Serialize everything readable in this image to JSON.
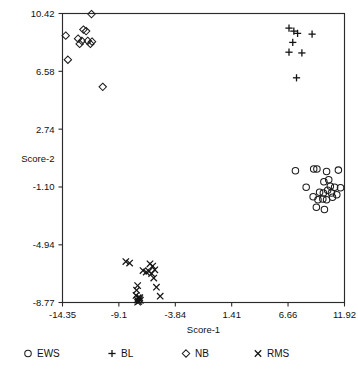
{
  "chart_data": {
    "type": "scatter",
    "title": "",
    "xlabel": "Score-1",
    "ylabel": "Score-2",
    "xlim": [
      -14.35,
      11.92
    ],
    "ylim": [
      -8.77,
      10.42
    ],
    "xticks": [
      "-14.35",
      "-9.1",
      "-3.84",
      "1.41",
      "6.66",
      "11.92"
    ],
    "xtick_values": [
      -14.35,
      -9.1,
      -3.84,
      1.41,
      6.66,
      11.92
    ],
    "yticks": [
      "10.42",
      "6.58",
      "2.74",
      "-1.10",
      "-4.94",
      "-8.77"
    ],
    "ytick_values": [
      10.42,
      6.58,
      2.74,
      -1.1,
      -4.94,
      -8.77
    ],
    "grid": false,
    "legend_position": "below",
    "series": [
      {
        "name": "EWS",
        "marker": "circle",
        "points": [
          [
            7.35,
            -0.02
          ],
          [
            9.05,
            0.09
          ],
          [
            9.35,
            0.1
          ],
          [
            10.25,
            -0.07
          ],
          [
            11.35,
            0.02
          ],
          [
            8.35,
            -1.12
          ],
          [
            10.0,
            -0.75
          ],
          [
            10.45,
            -0.62
          ],
          [
            10.6,
            -1.05
          ],
          [
            11.0,
            -1.12
          ],
          [
            11.55,
            -1.15
          ],
          [
            9.6,
            -1.45
          ],
          [
            9.95,
            -1.5
          ],
          [
            10.35,
            -1.32
          ],
          [
            10.7,
            -1.5
          ],
          [
            9.0,
            -1.75
          ],
          [
            9.45,
            -1.95
          ],
          [
            9.9,
            -1.9
          ],
          [
            10.25,
            -1.95
          ],
          [
            10.8,
            -1.78
          ],
          [
            11.2,
            -1.62
          ],
          [
            9.3,
            -2.45
          ],
          [
            10.05,
            -2.6
          ]
        ]
      },
      {
        "name": "BL",
        "marker": "plus",
        "points": [
          [
            6.75,
            9.45
          ],
          [
            7.2,
            9.25
          ],
          [
            7.55,
            9.1
          ],
          [
            8.9,
            9.05
          ],
          [
            7.1,
            8.5
          ],
          [
            6.75,
            7.85
          ],
          [
            7.95,
            7.8
          ],
          [
            7.45,
            6.15
          ]
        ]
      },
      {
        "name": "NB",
        "marker": "diamond",
        "points": [
          [
            -11.65,
            10.38
          ],
          [
            -12.4,
            9.35
          ],
          [
            -12.15,
            9.25
          ],
          [
            -14.05,
            8.95
          ],
          [
            -12.9,
            8.75
          ],
          [
            -12.55,
            8.6
          ],
          [
            -12.0,
            8.6
          ],
          [
            -11.6,
            8.55
          ],
          [
            -11.75,
            8.4
          ],
          [
            -12.75,
            8.4
          ],
          [
            -13.85,
            7.35
          ],
          [
            -10.6,
            5.55
          ]
        ]
      },
      {
        "name": "RMS",
        "marker": "x",
        "points": [
          [
            -8.45,
            -6.05
          ],
          [
            -8.1,
            -6.15
          ],
          [
            -6.2,
            -6.2
          ],
          [
            -5.95,
            -6.35
          ],
          [
            -6.85,
            -6.65
          ],
          [
            -6.55,
            -6.75
          ],
          [
            -6.3,
            -6.7
          ],
          [
            -6.05,
            -6.85
          ],
          [
            -5.75,
            -6.6
          ],
          [
            -5.85,
            -7.15
          ],
          [
            -7.35,
            -7.65
          ],
          [
            -7.45,
            -7.95
          ],
          [
            -7.3,
            -8.45
          ],
          [
            -7.2,
            -8.55
          ],
          [
            -7.4,
            -8.6
          ],
          [
            -7.25,
            -8.7
          ],
          [
            -7.1,
            -8.62
          ],
          [
            -7.35,
            -8.75
          ],
          [
            -7.15,
            -8.45
          ],
          [
            -7.5,
            -8.3
          ],
          [
            -5.6,
            -7.75
          ],
          [
            -5.25,
            -8.35
          ]
        ]
      }
    ]
  },
  "legend": {
    "items": [
      {
        "label": "EWS",
        "marker": "circle"
      },
      {
        "label": "BL",
        "marker": "plus"
      },
      {
        "label": "NB",
        "marker": "diamond"
      },
      {
        "label": "RMS",
        "marker": "x"
      }
    ]
  }
}
